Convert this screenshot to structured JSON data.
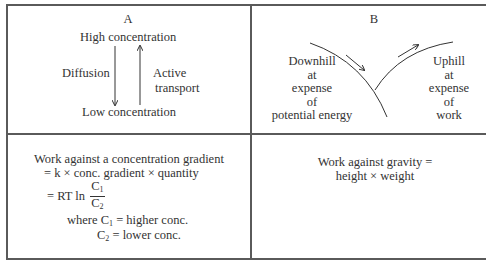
{
  "panels": {
    "a": {
      "label": "A",
      "top_text": "High concentration",
      "bottom_text": "Low concentration",
      "left_arrow_label": "Diffusion",
      "right_arrow_label_line1": "Active",
      "right_arrow_label_line2": "transport"
    },
    "b": {
      "label": "B",
      "left_text": [
        "Downhill",
        "at",
        "expense",
        "of",
        "potential energy"
      ],
      "right_text": [
        "Uphill",
        "at",
        "expense",
        "of",
        "work"
      ]
    },
    "c": {
      "line1": "Work against a concentration gradient",
      "line2": "= k × conc. gradient × quantity",
      "line3_prefix": "= RT ln",
      "frac_num": "C",
      "frac_num_sub": "1",
      "frac_den": "C",
      "frac_den_sub": "2",
      "where_prefix": "where C",
      "where_sub1": "1",
      "where_rest1": " = higher conc.",
      "where2_c": "C",
      "where_sub2": "2",
      "where_rest2": " = lower conc."
    },
    "d": {
      "line1": "Work against gravity =",
      "line2": "height × weight"
    }
  },
  "colors": {
    "line": "#5a5a5a",
    "text": "#333333"
  }
}
